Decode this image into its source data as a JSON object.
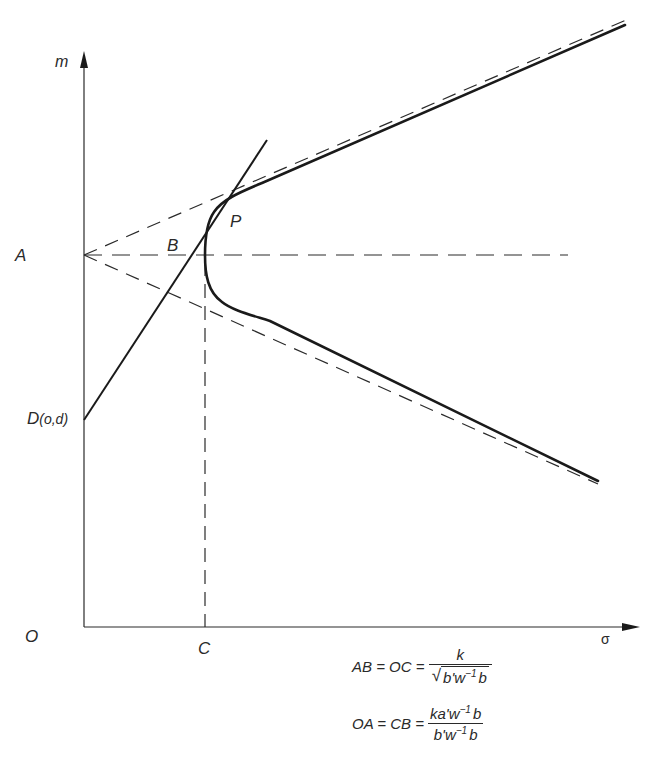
{
  "diagram": {
    "axes": {
      "y_label": "m",
      "x_label": "σ",
      "origin_label": "O"
    },
    "points": {
      "A": "A",
      "B": "B",
      "P": "P",
      "C": "C",
      "D": "D",
      "D_sub": "(o,d)"
    },
    "formulas": [
      {
        "lhs": "AB = OC =",
        "numerator": "k",
        "denominator_sqrt": "b'w",
        "denominator_exp": "−1",
        "denominator_tail": "b"
      },
      {
        "lhs": "OA = CB =",
        "numerator_a": "ka'w",
        "numerator_exp": "−1",
        "numerator_tail": "b",
        "denominator_a": "b'w",
        "denominator_exp": "−1",
        "denominator_tail": "b"
      }
    ],
    "colors": {
      "ink": "#2a2a2a",
      "background": "#ffffff"
    }
  }
}
